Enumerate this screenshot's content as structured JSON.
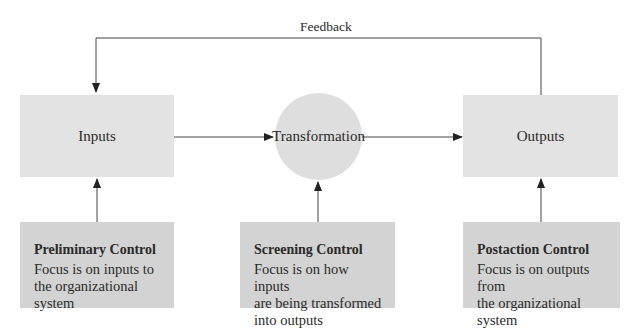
{
  "diagram": {
    "feedback_label": "Feedback",
    "nodes": {
      "inputs": "Inputs",
      "transformation": "Transformation",
      "outputs": "Outputs"
    },
    "controls": [
      {
        "title": "Preliminary Control",
        "desc": "Focus is on inputs to the organizational system",
        "lines": [
          "Focus is on inputs to",
          "the organizational system"
        ]
      },
      {
        "title": "Screening Control",
        "desc": "Focus is on how inputs are being transformed into outputs",
        "lines": [
          "Focus is on how inputs",
          "are being transformed",
          "into outputs"
        ]
      },
      {
        "title": "Postaction Control",
        "desc": "Focus is on outputs from the organizational system",
        "lines": [
          "Focus is on outputs from",
          "the organizational system"
        ]
      }
    ],
    "colors": {
      "top_box": "#e3e3e3",
      "circle": "#dedede",
      "control_box": "#d3d3d3",
      "line": "#333333"
    }
  }
}
